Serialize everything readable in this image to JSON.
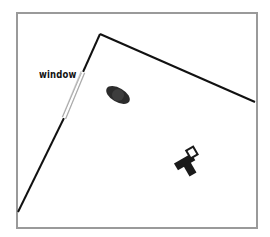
{
  "diagram": {
    "type": "floor-plan",
    "labels": {
      "window": "window"
    },
    "colors": {
      "frame": "#9a9a9a",
      "wall": "#111111",
      "window": "#bdbdbd",
      "object": "#1a1a1a",
      "background": "#ffffff"
    },
    "objects": [
      {
        "name": "round-object",
        "icon": "rug-icon"
      },
      {
        "name": "t-shaped-object",
        "icon": "furniture-icon"
      }
    ]
  }
}
